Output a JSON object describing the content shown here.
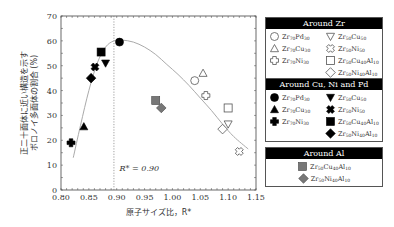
{
  "chart_data": {
    "type": "scatter",
    "title": "",
    "xlabel": "原子サイズ比，R*",
    "ylabel_lines": [
      "正二十面体に近い構造を示す",
      "ボロノイ多面体の割合 (%)"
    ],
    "xlim": [
      0.8,
      1.15
    ],
    "ylim": [
      0,
      70
    ],
    "xticks": [
      "0.80",
      "0.85",
      "0.90",
      "0.95",
      "1.00",
      "1.05",
      "1.10",
      "1.15"
    ],
    "yticks": [
      "0",
      "10",
      "20",
      "30",
      "40",
      "50",
      "60",
      "70"
    ],
    "xtick_values": [
      0.8,
      0.85,
      0.9,
      0.95,
      1.0,
      1.05,
      1.1,
      1.15
    ],
    "ytick_values": [
      0,
      10,
      20,
      30,
      40,
      50,
      60,
      70
    ],
    "vline": {
      "x": 0.895,
      "style": "dotted"
    },
    "annotation": {
      "text": "R* = 0.90",
      "x": 0.905,
      "y": 7.5
    },
    "fit_curve": {
      "color": "#aaaaaa",
      "points": [
        [
          0.822,
          13
        ],
        [
          0.835,
          26
        ],
        [
          0.85,
          40
        ],
        [
          0.865,
          51
        ],
        [
          0.88,
          57.5
        ],
        [
          0.895,
          60
        ],
        [
          0.91,
          60.3
        ],
        [
          0.93,
          59.5
        ],
        [
          0.95,
          57.5
        ],
        [
          0.97,
          54.5
        ],
        [
          0.99,
          50.5
        ],
        [
          1.01,
          46.5
        ],
        [
          1.03,
          42
        ],
        [
          1.05,
          37
        ],
        [
          1.07,
          32
        ],
        [
          1.09,
          26.5
        ],
        [
          1.11,
          21.5
        ],
        [
          1.136,
          16.5
        ]
      ]
    },
    "series": [
      {
        "group": "zr",
        "name": "Zr70Pd30",
        "marker": "circle",
        "fill": "open",
        "x": 1.04,
        "y": 44
      },
      {
        "group": "zr",
        "name": "Zr70Cu30",
        "marker": "triangle",
        "fill": "open",
        "x": 1.055,
        "y": 47
      },
      {
        "group": "zr",
        "name": "Zr70Ni30",
        "marker": "cross",
        "fill": "open",
        "x": 1.06,
        "y": 38
      },
      {
        "group": "zr",
        "name": "Zr50Cu50",
        "marker": "triangle-down",
        "fill": "open",
        "x": 1.1,
        "y": 26.5
      },
      {
        "group": "zr",
        "name": "Zr50Ni50",
        "marker": "x",
        "fill": "open",
        "x": 1.12,
        "y": 15.5
      },
      {
        "group": "zr",
        "name": "Zr50Cu40Al10",
        "marker": "square",
        "fill": "open",
        "x": 1.1,
        "y": 33
      },
      {
        "group": "zr",
        "name": "Zr50Ni40Al10",
        "marker": "diamond",
        "fill": "open",
        "x": 1.09,
        "y": 24.5
      },
      {
        "group": "cu",
        "name": "Zr70Pd30",
        "marker": "circle",
        "fill": "black",
        "x": 0.905,
        "y": 59.5
      },
      {
        "group": "cu",
        "name": "Zr70Cu30",
        "marker": "triangle",
        "fill": "black",
        "x": 0.841,
        "y": 25.5
      },
      {
        "group": "cu",
        "name": "Zr70Ni30",
        "marker": "cross",
        "fill": "black",
        "x": 0.818,
        "y": 19
      },
      {
        "group": "cu",
        "name": "Zr50Cu50",
        "marker": "triangle-down",
        "fill": "black",
        "x": 0.88,
        "y": 51
      },
      {
        "group": "cu",
        "name": "Zr50Ni50",
        "marker": "x",
        "fill": "black",
        "x": 0.861,
        "y": 49.5
      },
      {
        "group": "cu",
        "name": "Zr50Cu40Al10",
        "marker": "square",
        "fill": "black",
        "x": 0.872,
        "y": 55.5
      },
      {
        "group": "cu",
        "name": "Zr50Ni40Al10",
        "marker": "diamond",
        "fill": "black",
        "x": 0.854,
        "y": 45
      },
      {
        "group": "al",
        "name": "Zr50Cu40Al10",
        "marker": "square",
        "fill": "gray",
        "x": 0.97,
        "y": 36
      },
      {
        "group": "al",
        "name": "Zr50Ni40Al10",
        "marker": "diamond",
        "fill": "gray",
        "x": 0.98,
        "y": 33
      }
    ],
    "legend": [
      {
        "title": "Around Zr",
        "fill": "open",
        "items": [
          {
            "marker": "circle",
            "base": "Zr",
            "parts": [
              [
                "Zr",
                "70"
              ],
              [
                "Pd",
                "30"
              ]
            ]
          },
          {
            "marker": "triangle-down",
            "parts": [
              [
                "Zr",
                "50"
              ],
              [
                "Cu",
                "50"
              ]
            ]
          },
          {
            "marker": "triangle",
            "parts": [
              [
                "Zr",
                "70"
              ],
              [
                "Cu",
                "30"
              ]
            ]
          },
          {
            "marker": "x",
            "parts": [
              [
                "Zr",
                "50"
              ],
              [
                "Ni",
                "50"
              ]
            ]
          },
          {
            "marker": "cross",
            "parts": [
              [
                "Zr",
                "70"
              ],
              [
                "Ni",
                "30"
              ]
            ]
          },
          {
            "marker": "square",
            "parts": [
              [
                "Zr",
                "50"
              ],
              [
                "Cu",
                "40"
              ],
              [
                "Al",
                "10"
              ]
            ]
          },
          {
            "marker": "none",
            "parts": []
          },
          {
            "marker": "diamond",
            "parts": [
              [
                "Zr",
                "50"
              ],
              [
                "Ni",
                "40"
              ],
              [
                "Al",
                "10"
              ]
            ]
          }
        ]
      },
      {
        "title": "Around Cu,  Ni and Pd",
        "fill": "black",
        "items": [
          {
            "marker": "circle",
            "parts": [
              [
                "Zr",
                "70"
              ],
              [
                "Pd",
                "30"
              ]
            ]
          },
          {
            "marker": "triangle-down",
            "parts": [
              [
                "Zr",
                "50"
              ],
              [
                "Cu",
                "50"
              ]
            ]
          },
          {
            "marker": "triangle",
            "parts": [
              [
                "Zr",
                "70"
              ],
              [
                "Cu",
                "30"
              ]
            ]
          },
          {
            "marker": "x",
            "parts": [
              [
                "Zr",
                "50"
              ],
              [
                "Ni",
                "50"
              ]
            ]
          },
          {
            "marker": "cross",
            "parts": [
              [
                "Zr",
                "70"
              ],
              [
                "Ni",
                "30"
              ]
            ]
          },
          {
            "marker": "square",
            "parts": [
              [
                "Zr",
                "50"
              ],
              [
                "Cu",
                "40"
              ],
              [
                "Al",
                "10"
              ]
            ]
          },
          {
            "marker": "none",
            "parts": []
          },
          {
            "marker": "diamond",
            "parts": [
              [
                "Zr",
                "50"
              ],
              [
                "Ni",
                "40"
              ],
              [
                "Al",
                "10"
              ]
            ]
          }
        ]
      },
      {
        "title": "Around Al",
        "fill": "gray",
        "single": true,
        "items": [
          {
            "marker": "square",
            "parts": [
              [
                "Zr",
                "50"
              ],
              [
                "Cu",
                "40"
              ],
              [
                "Al",
                "10"
              ]
            ]
          },
          {
            "marker": "diamond",
            "parts": [
              [
                "Zr",
                "50"
              ],
              [
                "Ni",
                "40"
              ],
              [
                "Al",
                "10"
              ]
            ]
          }
        ]
      }
    ],
    "colors": {
      "open_stroke": "#555555",
      "black": "#000000",
      "gray_fill": "#777777",
      "gray_stroke": "#444444",
      "curve": "#aaaaaa",
      "axis": "#444444"
    }
  }
}
